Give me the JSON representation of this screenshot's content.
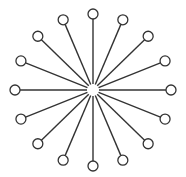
{
  "diagram": {
    "type": "star-network",
    "center": {
      "x": 93,
      "y": 90
    },
    "hub_gap_radius": 6,
    "node_radius": 5,
    "spoke_radius_x": 78,
    "spoke_radius_y": 76,
    "node_count": 16,
    "stroke_color": "#333333",
    "fill_color": "#ffffff"
  }
}
